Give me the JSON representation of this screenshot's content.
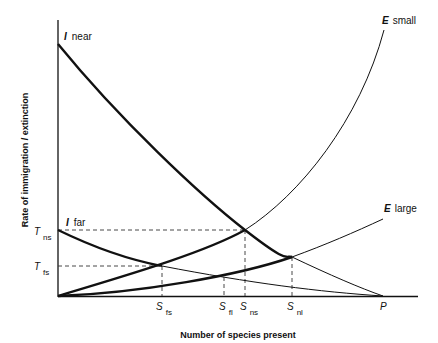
{
  "diagram": {
    "xlabel": "Number of species present",
    "ylabel": "Rate of immigration / extinction",
    "curves": [
      {
        "id": "I_near",
        "letter": "I",
        "label": "near"
      },
      {
        "id": "I_far",
        "letter": "I",
        "label": "far"
      },
      {
        "id": "E_small",
        "letter": "E",
        "label": "small"
      },
      {
        "id": "E_large",
        "letter": "E",
        "label": "large"
      }
    ],
    "y_ticks": [
      {
        "letter": "T",
        "sub": "ns"
      },
      {
        "letter": "T",
        "sub": "fs"
      }
    ],
    "x_ticks": [
      {
        "letter": "S",
        "sub": "fs"
      },
      {
        "letter": "S",
        "sub": "fl"
      },
      {
        "letter": "S",
        "sub": "ns"
      },
      {
        "letter": "S",
        "sub": "nl"
      },
      {
        "letter": "P",
        "sub": ""
      }
    ]
  }
}
